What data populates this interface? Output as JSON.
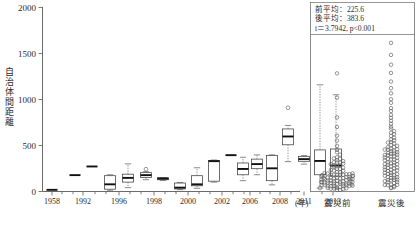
{
  "figure": {
    "y_axis_title": "自治体間距離",
    "x_unit_label": "(年)",
    "right_panel_labels": [
      "震災前",
      "震災後"
    ]
  },
  "stats_box": {
    "line1": "前平均：225.6",
    "line2": "後平均：383.6",
    "line3": "t＝3.7942, p<0.001"
  },
  "chart_data": {
    "type": "box",
    "title": "",
    "xlabel": "(年)",
    "ylabel": "自治体間距離",
    "ylim": [
      0,
      2000
    ],
    "yticks": [
      0,
      500,
      1000,
      1500,
      2000
    ],
    "ytick_labels": [
      "0",
      "500",
      "1000",
      "1500",
      "2000"
    ],
    "grid": false,
    "legend": "none",
    "categories": [
      "1958",
      "1992",
      "1996",
      "1998",
      "2000",
      "2002",
      "2006",
      "2008",
      "2011",
      "2013"
    ],
    "boxes": [
      {
        "x": 52,
        "label": "1958",
        "min": 18,
        "q1": 18,
        "median": 18,
        "q3": 18,
        "max": 18,
        "outliers": []
      },
      {
        "x": 75,
        "label": "1992",
        "min": 178,
        "q1": 178,
        "median": 178,
        "q3": 178,
        "max": 178,
        "outliers": []
      },
      {
        "x": 92,
        "label": "1992b",
        "min": 272,
        "q1": 272,
        "median": 272,
        "q3": 272,
        "max": 272,
        "outliers": []
      },
      {
        "x": 110,
        "label": "1996",
        "min": 8,
        "q1": 25,
        "median": 78,
        "q3": 172,
        "max": 182,
        "outliers": []
      },
      {
        "x": 128,
        "label": "1996b",
        "min": 42,
        "q1": 102,
        "median": 148,
        "q3": 188,
        "max": 300,
        "outliers": []
      },
      {
        "x": 146,
        "label": "1998",
        "min": 128,
        "q1": 152,
        "median": 178,
        "q3": 205,
        "max": 215,
        "outliers": [
          242
        ]
      },
      {
        "x": 163,
        "label": "1998b",
        "min": 120,
        "q1": 128,
        "median": 140,
        "q3": 150,
        "max": 152,
        "outliers": []
      },
      {
        "x": 180,
        "label": "2000",
        "min": 20,
        "q1": 28,
        "median": 42,
        "q3": 92,
        "max": 98,
        "outliers": []
      },
      {
        "x": 197,
        "label": "2000b",
        "min": 35,
        "q1": 62,
        "median": 78,
        "q3": 172,
        "max": 258,
        "outliers": []
      },
      {
        "x": 214,
        "label": "2002",
        "min": 102,
        "q1": 112,
        "median": 330,
        "q3": 338,
        "max": 342,
        "outliers": []
      },
      {
        "x": 231,
        "label": "2002b",
        "min": 395,
        "q1": 395,
        "median": 395,
        "q3": 395,
        "max": 395,
        "outliers": []
      },
      {
        "x": 243,
        "label": "2006",
        "min": 118,
        "q1": 182,
        "median": 245,
        "q3": 310,
        "max": 372,
        "outliers": []
      },
      {
        "x": 257,
        "label": "2006b",
        "min": 182,
        "q1": 248,
        "median": 298,
        "q3": 352,
        "max": 398,
        "outliers": []
      },
      {
        "x": 272,
        "label": "2008",
        "min": 72,
        "q1": 118,
        "median": 252,
        "q3": 392,
        "max": 398,
        "outliers": []
      },
      {
        "x": 288,
        "label": "2008b",
        "min": 325,
        "q1": 508,
        "median": 598,
        "q3": 680,
        "max": 718,
        "outliers": [
          910
        ]
      },
      {
        "x": 304,
        "label": "2011",
        "min": 298,
        "q1": 328,
        "median": 352,
        "q3": 382,
        "max": 390,
        "outliers": []
      },
      {
        "x": 320,
        "label": "2011b",
        "min": 38,
        "q1": 182,
        "median": 332,
        "q3": 452,
        "max": 1160,
        "outliers": [
          1900,
          38
        ]
      },
      {
        "x": 336,
        "label": "2013",
        "min": 40,
        "q1": 168,
        "median": 282,
        "q3": 462,
        "max": 1052,
        "outliers": []
      }
    ],
    "strip_panels": [
      {
        "label": "震災前",
        "mean": 225.6,
        "values": [
          18,
          22,
          28,
          30,
          35,
          38,
          42,
          45,
          48,
          52,
          55,
          58,
          60,
          62,
          65,
          68,
          70,
          72,
          75,
          78,
          80,
          82,
          85,
          88,
          90,
          92,
          95,
          98,
          100,
          102,
          105,
          108,
          110,
          112,
          115,
          118,
          120,
          122,
          125,
          128,
          130,
          132,
          135,
          138,
          140,
          142,
          145,
          148,
          150,
          152,
          155,
          158,
          160,
          162,
          165,
          168,
          170,
          172,
          175,
          178,
          180,
          182,
          185,
          188,
          190,
          195,
          200,
          205,
          210,
          215,
          220,
          228,
          235,
          242,
          250,
          258,
          265,
          272,
          280,
          288,
          295,
          302,
          310,
          318,
          325,
          335,
          345,
          355,
          365,
          378,
          395,
          420,
          455,
          498,
          552,
          612,
          705,
          812,
          1015,
          1290
        ]
      },
      {
        "label": "震災後",
        "mean": 383.6,
        "values": [
          35,
          42,
          48,
          55,
          62,
          68,
          75,
          82,
          88,
          95,
          102,
          108,
          115,
          122,
          128,
          135,
          142,
          148,
          155,
          162,
          168,
          175,
          182,
          188,
          195,
          202,
          208,
          215,
          222,
          228,
          235,
          242,
          248,
          255,
          262,
          268,
          275,
          282,
          288,
          295,
          302,
          308,
          315,
          322,
          328,
          335,
          342,
          348,
          355,
          362,
          368,
          375,
          382,
          388,
          395,
          402,
          408,
          415,
          422,
          428,
          435,
          442,
          448,
          455,
          462,
          470,
          478,
          486,
          495,
          505,
          515,
          525,
          538,
          552,
          568,
          585,
          602,
          620,
          640,
          662,
          685,
          710,
          738,
          768,
          800,
          835,
          872,
          912,
          958,
          1008,
          1065,
          1128,
          1200,
          1285,
          1380,
          1490,
          1615,
          1760,
          1880,
          1925
        ]
      }
    ],
    "annotations": [
      "前平均：225.6",
      "後平均：383.6",
      "t＝3.7942, p<0.001"
    ]
  }
}
